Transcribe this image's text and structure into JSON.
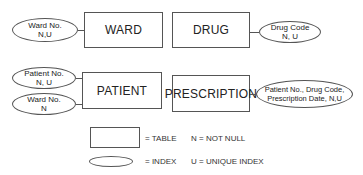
{
  "tables": {
    "ward": "WARD",
    "drug": "DRUG",
    "patient": "PATIENT",
    "prescription": "PRESCRIPTION"
  },
  "indexes": {
    "ward_no_ward": {
      "line1": "Ward No.",
      "line2": "N,U"
    },
    "drug_code": {
      "line1": "Drug Code",
      "line2": "N, U"
    },
    "patient_no": {
      "line1": "Patient No.",
      "line2": "N, U"
    },
    "ward_no_patient": {
      "line1": "Ward No.",
      "line2": "N"
    },
    "prescription_key": {
      "line1": "Patient No., Drug Code,",
      "line2": "Prescription Date, N,U"
    }
  },
  "legend": {
    "table": "= TABLE",
    "index": "= INDEX",
    "not_null": "N = NOT NULL",
    "unique_index": "U = UNIQUE INDEX"
  }
}
